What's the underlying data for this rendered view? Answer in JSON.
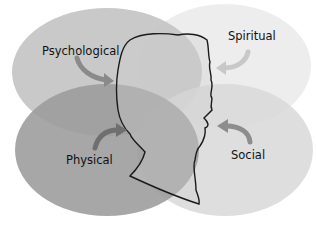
{
  "diagram": {
    "title": "",
    "segments": [
      {
        "id": "psychological",
        "label": "Psychological",
        "color": "#c9c9c9"
      },
      {
        "id": "spiritual",
        "label": "Spiritual",
        "color": "#ebebeb"
      },
      {
        "id": "physical",
        "label": "Physical",
        "color": "#9e9e9e"
      },
      {
        "id": "social",
        "label": "Social",
        "color": "#d6d6d6"
      }
    ],
    "center_figure": "head-profile-silhouette",
    "arrow_color": "#8a8a8a"
  }
}
